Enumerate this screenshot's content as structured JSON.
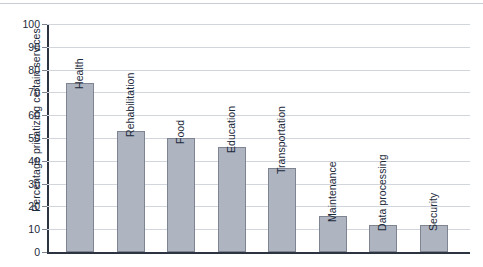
{
  "chart_data": {
    "type": "bar",
    "title": "",
    "subtitle": "",
    "xlabel": "",
    "ylabel": "Percentage privatizing certain services",
    "ylim": [
      0,
      100
    ],
    "ytick_step": 10,
    "yticks": [
      "100",
      "90",
      "80",
      "70",
      "60",
      "50",
      "40",
      "30",
      "20",
      "10",
      "0"
    ],
    "grid": true,
    "legend": false,
    "legend_position": "none",
    "orientation": "vertical",
    "bar_color": "#aeb4c0",
    "bar_border_color": "#7e8492",
    "axis_color": "#2b3440",
    "gridline_color": "#d2d5dc",
    "text_color": "#1c2a3a",
    "label_rotation": -90,
    "categories": [
      "Health",
      "Rehabilitation",
      "Food",
      "Education",
      "Transportation",
      "Maintenance",
      "Data processing",
      "Security"
    ],
    "values": [
      74,
      53,
      50,
      46,
      37,
      16,
      12,
      12
    ]
  }
}
